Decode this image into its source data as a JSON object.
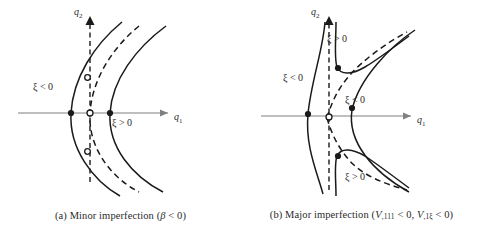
{
  "figure": {
    "panels": [
      {
        "id": "a",
        "caption_prefix": "(a)",
        "caption_text": "Minor imperfection",
        "caption_paren_open": "(",
        "caption_symbol": "β",
        "caption_relation": " < 0",
        "caption_paren_close": ")",
        "caption_full": "(a) Minor imperfection (β < 0)",
        "axes": {
          "x_label": "q",
          "x_sub": "1",
          "y_label": "q",
          "y_sub": "2"
        },
        "annotations": [
          {
            "name": "xi-negative-left",
            "text": "ξ < 0",
            "x": 33,
            "y": 86
          },
          {
            "name": "xi-positive-right",
            "text": "ξ > 0",
            "x": 112,
            "y": 122
          }
        ],
        "markers": [
          {
            "name": "solid-dot-left-axis",
            "type": "filled",
            "x": 71,
            "y": 113
          },
          {
            "name": "open-dot-origin",
            "type": "open",
            "x": 90,
            "y": 113
          },
          {
            "name": "solid-dot-right-axis",
            "type": "filled",
            "x": 110,
            "y": 113
          },
          {
            "name": "open-dot-upper-crossing",
            "type": "open",
            "x": 87,
            "y": 77
          },
          {
            "name": "open-dot-lower-crossing",
            "type": "open",
            "x": 87,
            "y": 152
          }
        ],
        "curve_style": {
          "solid": "solid",
          "dashed": "dashed"
        }
      },
      {
        "id": "b",
        "caption_prefix": "(b)",
        "caption_text": "Major imperfection",
        "caption_paren_open": "(",
        "caption_symbol_1": "V",
        "caption_sub_1": ",111",
        "caption_relation_1": " < 0,",
        "caption_symbol_2": "V",
        "caption_sub_2": ",1ξ",
        "caption_relation_2": " < 0",
        "caption_paren_close": ")",
        "caption_full": "(b) Major imperfection (V,111 < 0, V,1ξ < 0)",
        "axes": {
          "x_label": "q",
          "x_sub": "1",
          "y_label": "q",
          "y_sub": "2"
        },
        "annotations": [
          {
            "name": "xi-positive-upper",
            "text": "ξ > 0",
            "x": 86,
            "y": 38
          },
          {
            "name": "xi-negative-left",
            "text": "ξ < 0",
            "x": 42,
            "y": 77
          },
          {
            "name": "xi-negative-right",
            "text": "ξ < 0",
            "x": 104,
            "y": 99
          },
          {
            "name": "xi-positive-lower",
            "text": "ξ > 0",
            "x": 86,
            "y": 175
          }
        ],
        "markers": [
          {
            "name": "solid-dot-left-axis",
            "type": "filled",
            "x": 67,
            "y": 114
          },
          {
            "name": "open-dot-origin",
            "type": "open",
            "x": 88,
            "y": 116
          },
          {
            "name": "solid-dot-right-axis",
            "type": "filled",
            "x": 111,
            "y": 107
          },
          {
            "name": "solid-dot-upper-hook",
            "type": "filled",
            "x": 96,
            "y": 68
          },
          {
            "name": "solid-dot-lower-hook",
            "type": "filled",
            "x": 96,
            "y": 156
          }
        ],
        "curve_style": {
          "solid": "solid",
          "dashed": "dashed"
        }
      }
    ],
    "colors": {
      "curve": "#1a1a1a",
      "axis": "#808080",
      "dashed_axis": "#1a1a1a",
      "text": "#2b2b2b",
      "background": "#ffffff"
    }
  }
}
